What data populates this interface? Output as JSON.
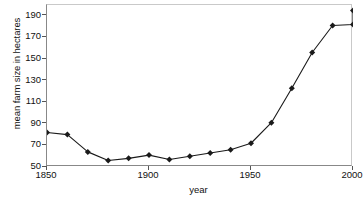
{
  "chart_data": {
    "type": "line",
    "title": "",
    "xlabel": "year",
    "ylabel": "mean farm size in hectares",
    "xlim": [
      1850,
      2000
    ],
    "ylim": [
      50,
      200
    ],
    "xticks": [
      1850,
      1900,
      1950,
      2000
    ],
    "yticks": [
      50,
      70,
      90,
      110,
      130,
      150,
      170,
      190
    ],
    "grid": false,
    "legend": null,
    "marker": "diamond",
    "line_color": "#1a1a1a",
    "marker_color": "#1a1a1a",
    "x": [
      1850,
      1860,
      1870,
      1880,
      1890,
      1900,
      1910,
      1920,
      1930,
      1940,
      1950,
      1960,
      1970,
      1980,
      1990,
      2000
    ],
    "values": [
      82,
      80,
      64,
      56,
      58,
      61,
      57,
      60,
      63,
      66,
      72,
      91,
      123,
      156,
      181,
      182
    ],
    "series": [
      {
        "name": "mean farm size",
        "values": [
          82,
          80,
          64,
          56,
          58,
          61,
          57,
          60,
          63,
          66,
          72,
          91,
          123,
          156,
          181,
          182
        ]
      }
    ],
    "extra_point": {
      "x": 2000,
      "y": 195
    }
  },
  "axes": {
    "y_tick_labels": [
      "190",
      "170",
      "150",
      "130",
      "110",
      "90",
      "70",
      "50"
    ],
    "x_tick_labels": [
      "1850",
      "1900",
      "1950",
      "2000"
    ],
    "x_axis_title": "year",
    "y_axis_title": "mean farm size in hectares"
  }
}
